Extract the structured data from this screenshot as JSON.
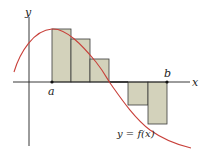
{
  "diagram": {
    "type": "riemann-sum",
    "axes": {
      "x_label": "x",
      "y_label": "y"
    },
    "interval": {
      "start_label": "a",
      "end_label": "b"
    },
    "curve_label": "y = f(x)",
    "colors": {
      "curve": "#c8403a",
      "rect_fill": "#d3d2bb",
      "rect_stroke": "#3a3a3a",
      "axis": "#222222"
    },
    "rectangles": [
      {
        "x": 52,
        "w": 19,
        "top": 29
      },
      {
        "x": 71,
        "w": 19,
        "top": 39
      },
      {
        "x": 90,
        "w": 19,
        "top": 59
      },
      {
        "x": 109,
        "w": 19,
        "top": 82
      },
      {
        "x": 128,
        "w": 20,
        "top": 105
      },
      {
        "x": 148,
        "w": 19,
        "top": 124
      }
    ]
  }
}
